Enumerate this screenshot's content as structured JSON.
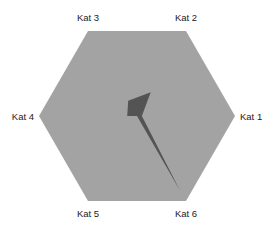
{
  "chart_data": {
    "type": "radar",
    "title": "",
    "categories": [
      "Kat 1",
      "Kat 2",
      "Kat 3",
      "Kat 4",
      "Kat 5",
      "Kat 6"
    ],
    "series": [
      {
        "name": "Series 1",
        "values": [
          0.05,
          0.28,
          0.18,
          0.1,
          0.0,
          0.88
        ]
      }
    ],
    "range": [
      0,
      1
    ],
    "grid": false,
    "legend": "none",
    "colors": {
      "background_polygon": "#a3a3a3",
      "series": "#545454"
    }
  }
}
